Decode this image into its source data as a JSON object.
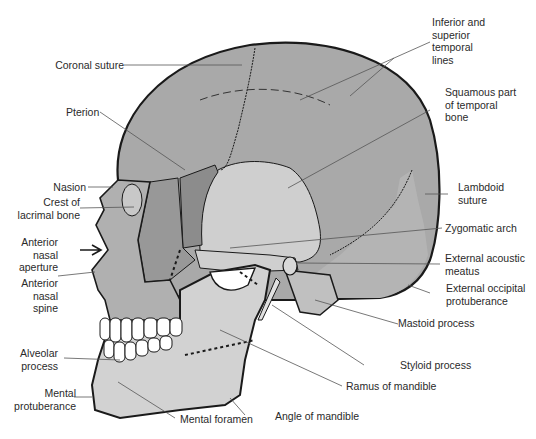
{
  "figure": {
    "colors": {
      "background": "#ffffff",
      "outline": "#1a1a1a",
      "leader_line": "#555555",
      "frontal_parietal": "#a9a9a9",
      "squamous_temporal": "#cfcfcf",
      "sphenoid_greater_wing": "#8c8c8c",
      "zygomatic": "#989898",
      "maxilla_nasal": "#b0b0b0",
      "mandible": "#d2d2d2",
      "occipital": "#b4b4b4",
      "teeth": "#ffffff"
    }
  },
  "labels": {
    "coronal_suture": "Coronal suture",
    "pterion": "Pterion",
    "nasion": "Nasion",
    "crest_lacrimal": "Crest of\nlacrimal bone",
    "anterior_nasal_aperture": "Anterior\nnasal\naperture",
    "anterior_nasal_spine": "Anterior\nnasal\nspine",
    "alveolar_process": "Alveolar\nprocess",
    "mental_protuberance": "Mental\nprotuberance",
    "mental_foramen": "Mental foramen",
    "angle_of_mandible": "Angle of mandible",
    "ramus_of_mandible": "Ramus of mandible",
    "styloid_process": "Styloid process",
    "mastoid_process": "Mastoid process",
    "external_occipital_protuberance": "External occipital\nprotuberance",
    "external_acoustic_meatus": "External acoustic\nmeatus",
    "zygomatic_arch": "Zygomatic arch",
    "lambdoid_suture": "Lambdoid\nsuture",
    "squamous_temporal": "Squamous part\nof temporal\nbone",
    "temporal_lines": "Inferior and\nsuperior\ntemporal\nlines"
  }
}
